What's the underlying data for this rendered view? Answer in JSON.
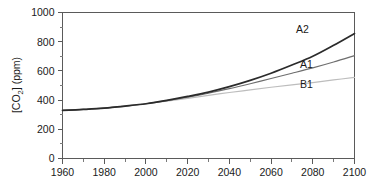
{
  "chart_data": {
    "type": "line",
    "title": "",
    "xlabel": "",
    "ylabel": "[CO2] (ppm)",
    "ylabel_prefix": "[CO",
    "ylabel_sub": "2",
    "ylabel_suffix": "] (ppm)",
    "xlim": [
      1960,
      2100
    ],
    "ylim": [
      0,
      1000
    ],
    "x_ticks": [
      1960,
      1980,
      2000,
      2020,
      2040,
      2060,
      2080,
      2100
    ],
    "x_tick_labels": [
      "1960",
      "1980",
      "2000",
      "2020",
      "2040",
      "2060",
      "2080",
      "2100"
    ],
    "x_minor_ticks": [
      1970,
      1990,
      2010,
      2030,
      2050,
      2070,
      2090
    ],
    "y_ticks": [
      0,
      200,
      400,
      600,
      800,
      1000
    ],
    "y_tick_labels": [
      "0",
      "200",
      "400",
      "600",
      "800",
      "1000"
    ],
    "y_minor_ticks": [
      100,
      300,
      500,
      700,
      900
    ],
    "grid": false,
    "legend_position": "inline-right",
    "x": [
      1960,
      1970,
      1980,
      1990,
      2000,
      2010,
      2020,
      2030,
      2040,
      2050,
      2060,
      2070,
      2080,
      2090,
      2100
    ],
    "series": [
      {
        "name": "A2",
        "label": "A2",
        "color": "#2b2b2b",
        "width": 1.7,
        "values": [
          329,
          336,
          345,
          359,
          375,
          398,
          425,
          455,
          492,
          535,
          584,
          640,
          700,
          775,
          856
        ]
      },
      {
        "name": "A1",
        "label": "A1",
        "color": "#6e6e6e",
        "width": 1.2,
        "values": [
          329,
          336,
          345,
          359,
          375,
          396,
          420,
          447,
          478,
          512,
          548,
          584,
          621,
          661,
          705
        ]
      },
      {
        "name": "B1",
        "label": "B1",
        "color": "#bdbdbd",
        "width": 1.2,
        "values": [
          329,
          336,
          345,
          359,
          375,
          393,
          412,
          432,
          452,
          470,
          488,
          504,
          520,
          538,
          555
        ]
      }
    ],
    "annotations": [
      {
        "text": "A2",
        "x": 2075,
        "y": 860
      },
      {
        "text": "A1",
        "x": 2077,
        "y": 620
      },
      {
        "text": "B1",
        "x": 2077,
        "y": 480
      }
    ]
  }
}
